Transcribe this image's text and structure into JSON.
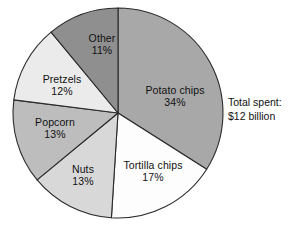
{
  "chart_data": {
    "type": "pie",
    "title": "",
    "subtitle": "",
    "xlabel": "",
    "ylabel": "",
    "legend_position": "none",
    "labels_inside_slices": true,
    "start_angle_deg": 0,
    "direction": "clockwise",
    "categories": [
      "Potato chips",
      "Tortilla chips",
      "Nuts",
      "Popcorn",
      "Pretzels",
      "Other"
    ],
    "values": [
      34,
      17,
      13,
      13,
      12,
      11
    ],
    "value_unit": "%",
    "slices": [
      {
        "label": "Potato chips",
        "value": 34,
        "pct_text": "34%",
        "color": "#a8a8a8",
        "label_x": 175,
        "label_y": 97
      },
      {
        "label": "Tortilla chips",
        "value": 17,
        "pct_text": "17%",
        "color": "#fdfdfd",
        "label_x": 153,
        "label_y": 172
      },
      {
        "label": "Nuts",
        "value": 13,
        "pct_text": "13%",
        "color": "#d8d8d8",
        "label_x": 83,
        "label_y": 176
      },
      {
        "label": "Popcorn",
        "value": 13,
        "pct_text": "13%",
        "color": "#bdbdbd",
        "label_x": 55,
        "label_y": 129
      },
      {
        "label": "Pretzels",
        "value": 12,
        "pct_text": "12%",
        "color": "#ebebeb",
        "label_x": 62,
        "label_y": 86
      },
      {
        "label": "Other",
        "value": 11,
        "pct_text": "11%",
        "color": "#8f8f8f",
        "label_x": 102,
        "label_y": 45
      }
    ],
    "annotations": [
      {
        "name": "total-spent",
        "line1": "Total spent:",
        "line2": "$12 billion"
      }
    ],
    "geometry": {
      "center_x": 118,
      "center_y": 113,
      "radius": 105
    },
    "colors": {
      "background": "#ffffff",
      "outline": "#2b2b2b",
      "text": "#111111"
    }
  }
}
